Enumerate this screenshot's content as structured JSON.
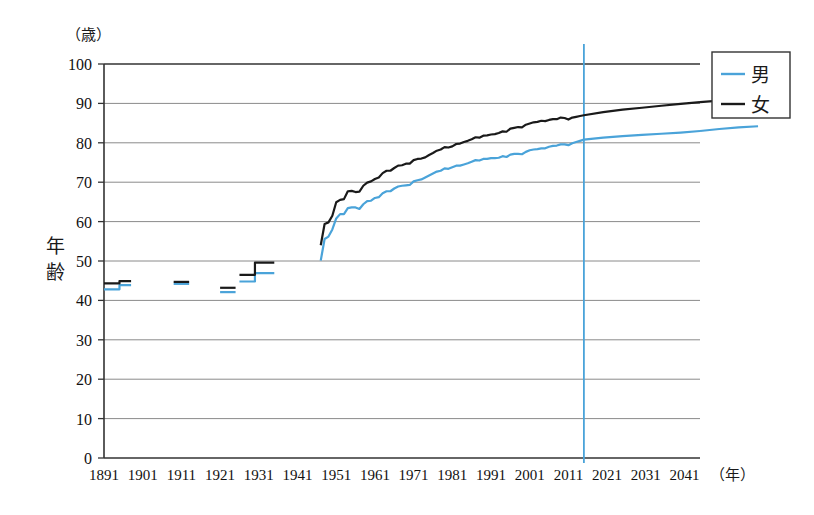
{
  "chart_data": {
    "type": "line",
    "title": "",
    "xlabel": "年",
    "ylabel": "年齢",
    "yunit": "（歳）",
    "xunit": "（年）",
    "xlim": [
      1891,
      2045
    ],
    "ylim": [
      0,
      100
    ],
    "grid": true,
    "legend_position": "top-right",
    "yticks": [
      "0",
      "10",
      "20",
      "30",
      "40",
      "50",
      "60",
      "70",
      "80",
      "90",
      "100"
    ],
    "ytick_values": [
      0,
      10,
      20,
      30,
      40,
      50,
      60,
      70,
      80,
      90,
      100
    ],
    "xticks": [
      "1891",
      "1901",
      "1911",
      "1921",
      "1931",
      "1941",
      "1951",
      "1961",
      "1971",
      "1981",
      "1991",
      "2001",
      "2011",
      "2021",
      "2031",
      "2041"
    ],
    "xtick_values": [
      1891,
      1901,
      1911,
      1921,
      1931,
      1941,
      1951,
      1961,
      1971,
      1981,
      1991,
      2001,
      2011,
      2021,
      2031,
      2041
    ],
    "annotations": [
      {
        "name": "current-year-marker",
        "type": "vline",
        "x": 2015,
        "color": "#4aa3d9",
        "label": ""
      }
    ],
    "series": [
      {
        "name": "男",
        "label": "男",
        "color": "#4aa3d9",
        "segments": [
          {
            "x": [
              1891,
              1895,
              1895,
              1898
            ],
            "y": [
              42.8,
              42.8,
              43.9,
              43.9
            ]
          },
          {
            "x": [
              1909,
              1913
            ],
            "y": [
              44.2,
              44.2
            ]
          },
          {
            "x": [
              1921,
              1925
            ],
            "y": [
              42.1,
              42.1
            ]
          },
          {
            "x": [
              1926,
              1930,
              1930,
              1935
            ],
            "y": [
              44.8,
              44.8,
              46.9,
              46.9
            ]
          },
          {
            "x": [
              1947,
              1948,
              1949,
              1950,
              1951,
              1952,
              1953,
              1954,
              1955,
              1956,
              1957,
              1958,
              1959,
              1960,
              1961,
              1962,
              1963,
              1964,
              1965,
              1966,
              1967,
              1968,
              1969,
              1970,
              1971,
              1972,
              1973,
              1974,
              1975,
              1976,
              1977,
              1978,
              1979,
              1980,
              1981,
              1982,
              1983,
              1984,
              1985,
              1986,
              1987,
              1988,
              1989,
              1990,
              1991,
              1992,
              1993,
              1994,
              1995,
              1996,
              1997,
              1998,
              1999,
              2000,
              2001,
              2002,
              2003,
              2004,
              2005,
              2006,
              2007,
              2008,
              2009,
              2010,
              2011,
              2012,
              2013,
              2014,
              2015,
              2020,
              2025,
              2030,
              2035,
              2040,
              2045
            ],
            "y": [
              50.1,
              55.6,
              56.2,
              58.0,
              60.8,
              61.9,
              61.9,
              63.4,
              63.6,
              63.6,
              63.2,
              64.4,
              65.2,
              65.3,
              66.0,
              66.2,
              67.2,
              67.7,
              67.7,
              68.4,
              68.9,
              69.1,
              69.2,
              69.3,
              70.2,
              70.5,
              70.7,
              71.2,
              71.7,
              72.2,
              72.7,
              72.9,
              73.5,
              73.4,
              73.8,
              74.2,
              74.2,
              74.5,
              74.8,
              75.2,
              75.6,
              75.5,
              75.9,
              75.9,
              76.1,
              76.1,
              76.2,
              76.6,
              76.4,
              77.0,
              77.2,
              77.2,
              77.1,
              77.7,
              78.1,
              78.3,
              78.4,
              78.6,
              78.6,
              79.0,
              79.2,
              79.3,
              79.6,
              79.6,
              79.4,
              79.9,
              80.2,
              80.5,
              80.8,
              81.3,
              81.7,
              82.0,
              82.3,
              82.6,
              83.0
            ]
          },
          {
            "x": [
              2045,
              2050,
              2055,
              2060
            ],
            "y": [
              83.0,
              83.5,
              83.9,
              84.2
            ]
          }
        ]
      },
      {
        "name": "女",
        "label": "女",
        "color": "#1a1a1a",
        "segments": [
          {
            "x": [
              1891,
              1895,
              1895,
              1898
            ],
            "y": [
              44.3,
              44.3,
              44.9,
              44.9
            ]
          },
          {
            "x": [
              1909,
              1913
            ],
            "y": [
              44.7,
              44.7
            ]
          },
          {
            "x": [
              1921,
              1925
            ],
            "y": [
              43.2,
              43.2
            ]
          },
          {
            "x": [
              1926,
              1930,
              1930,
              1935
            ],
            "y": [
              46.5,
              46.5,
              49.6,
              49.6
            ]
          },
          {
            "x": [
              1947,
              1948,
              1949,
              1950,
              1951,
              1952,
              1953,
              1954,
              1955,
              1956,
              1957,
              1958,
              1959,
              1960,
              1961,
              1962,
              1963,
              1964,
              1965,
              1966,
              1967,
              1968,
              1969,
              1970,
              1971,
              1972,
              1973,
              1974,
              1975,
              1976,
              1977,
              1978,
              1979,
              1980,
              1981,
              1982,
              1983,
              1984,
              1985,
              1986,
              1987,
              1988,
              1989,
              1990,
              1991,
              1992,
              1993,
              1994,
              1995,
              1996,
              1997,
              1998,
              1999,
              2000,
              2001,
              2002,
              2003,
              2004,
              2005,
              2006,
              2007,
              2008,
              2009,
              2010,
              2011,
              2012,
              2013,
              2014,
              2015,
              2020,
              2025,
              2030,
              2035,
              2040,
              2045
            ],
            "y": [
              54.0,
              59.4,
              59.8,
              61.5,
              64.9,
              65.5,
              65.7,
              67.7,
              67.8,
              67.5,
              67.6,
              69.1,
              69.9,
              70.2,
              70.8,
              71.2,
              72.3,
              72.9,
              72.9,
              73.6,
              74.2,
              74.3,
              74.7,
              74.7,
              75.6,
              75.9,
              76.0,
              76.3,
              76.9,
              77.4,
              78.0,
              78.3,
              78.9,
              78.8,
              79.1,
              79.7,
              79.8,
              80.2,
              80.5,
              80.9,
              81.4,
              81.3,
              81.8,
              81.9,
              82.1,
              82.2,
              82.5,
              82.9,
              82.8,
              83.6,
              83.8,
              84.0,
              83.9,
              84.6,
              84.9,
              85.2,
              85.3,
              85.6,
              85.5,
              85.8,
              86.0,
              86.0,
              86.4,
              86.3,
              85.9,
              86.4,
              86.6,
              86.8,
              87.0,
              87.8,
              88.4,
              88.9,
              89.4,
              89.9,
              90.3
            ]
          },
          {
            "x": [
              2045,
              2050,
              2055,
              2060
            ],
            "y": [
              90.3,
              90.7,
              91.0,
              91.2
            ]
          }
        ]
      }
    ]
  },
  "legend": {
    "items": [
      {
        "label": "男",
        "color": "#4aa3d9"
      },
      {
        "label": "女",
        "color": "#1a1a1a"
      }
    ]
  },
  "axis": {
    "y_title_chars": [
      "年",
      "齢"
    ],
    "y_unit": "（歳）",
    "x_unit": "（年）"
  }
}
